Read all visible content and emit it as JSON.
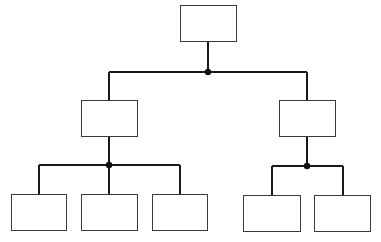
{
  "diagram": {
    "type": "org-chart",
    "colors": {
      "line": "#1a1a1a",
      "box_border": "#3a3a3a",
      "background": "#ffffff"
    },
    "nodes": [
      {
        "id": "root",
        "label": "",
        "x": 180,
        "y": 5,
        "w": 57,
        "h": 37
      },
      {
        "id": "mid-left",
        "label": "",
        "x": 81,
        "y": 100,
        "w": 57,
        "h": 37
      },
      {
        "id": "mid-right",
        "label": "",
        "x": 279,
        "y": 100,
        "w": 57,
        "h": 37
      },
      {
        "id": "leaf-1",
        "label": "",
        "x": 11,
        "y": 194,
        "w": 56,
        "h": 37
      },
      {
        "id": "leaf-2",
        "label": "",
        "x": 81,
        "y": 194,
        "w": 57,
        "h": 37
      },
      {
        "id": "leaf-3",
        "label": "",
        "x": 152,
        "y": 194,
        "w": 56,
        "h": 37
      },
      {
        "id": "leaf-4",
        "label": "",
        "x": 243,
        "y": 195,
        "w": 58,
        "h": 37
      },
      {
        "id": "leaf-5",
        "label": "",
        "x": 314,
        "y": 195,
        "w": 57,
        "h": 37
      }
    ],
    "edges": [
      {
        "from": "root",
        "to": "mid-left"
      },
      {
        "from": "root",
        "to": "mid-right"
      },
      {
        "from": "mid-left",
        "to": "leaf-1"
      },
      {
        "from": "mid-left",
        "to": "leaf-2"
      },
      {
        "from": "mid-left",
        "to": "leaf-3"
      },
      {
        "from": "mid-right",
        "to": "leaf-4"
      },
      {
        "from": "mid-right",
        "to": "leaf-5"
      }
    ],
    "junctions": [
      {
        "id": "junction-root",
        "x": 208,
        "y": 72
      },
      {
        "id": "junction-mid-left",
        "x": 109,
        "y": 165
      },
      {
        "id": "junction-mid-right",
        "x": 307,
        "y": 166
      }
    ]
  }
}
